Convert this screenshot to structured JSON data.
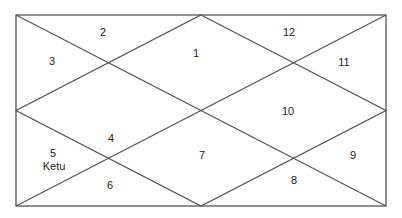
{
  "chart": {
    "type": "north-indian-horoscope",
    "line_color": "#555555",
    "houses": [
      {
        "number": "1",
        "planets": ""
      },
      {
        "number": "2",
        "planets": ""
      },
      {
        "number": "3",
        "planets": ""
      },
      {
        "number": "4",
        "planets": ""
      },
      {
        "number": "5",
        "planets": "Ketu"
      },
      {
        "number": "6",
        "planets": ""
      },
      {
        "number": "7",
        "planets": ""
      },
      {
        "number": "8",
        "planets": ""
      },
      {
        "number": "9",
        "planets": ""
      },
      {
        "number": "10",
        "planets": ""
      },
      {
        "number": "11",
        "planets": ""
      },
      {
        "number": "12",
        "planets": ""
      }
    ]
  }
}
